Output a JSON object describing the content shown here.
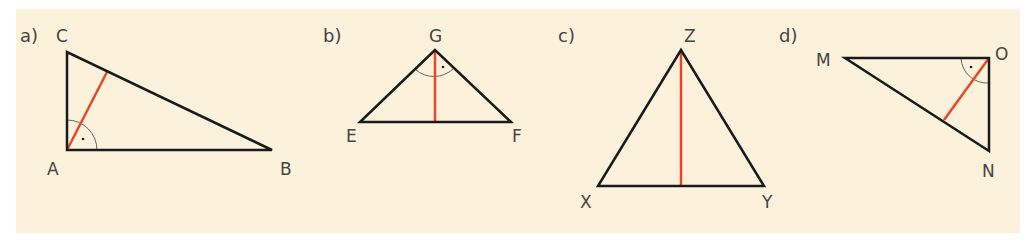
{
  "figures": [
    {
      "id": "a",
      "part_label": "a)",
      "vertices": {
        "A": "A",
        "B": "B",
        "C": "C"
      },
      "right_angle_at": "A",
      "red_segment": "altitude from A to BC"
    },
    {
      "id": "b",
      "part_label": "b)",
      "vertices": {
        "E": "E",
        "F": "F",
        "G": "G"
      },
      "right_angle_at": "G",
      "red_segment": "altitude from G to EF"
    },
    {
      "id": "c",
      "part_label": "c)",
      "vertices": {
        "X": "X",
        "Y": "Y",
        "Z": "Z"
      },
      "right_angle_at": null,
      "red_segment": "altitude from Z to XY"
    },
    {
      "id": "d",
      "part_label": "d)",
      "vertices": {
        "M": "M",
        "N": "N",
        "O": "O"
      },
      "right_angle_at": "O",
      "red_segment": "altitude from O to MN"
    }
  ],
  "colors": {
    "background": "#fcf2dc",
    "edge": "#1a1a1a",
    "altitude": "#e8482a",
    "arc": "#666666"
  }
}
